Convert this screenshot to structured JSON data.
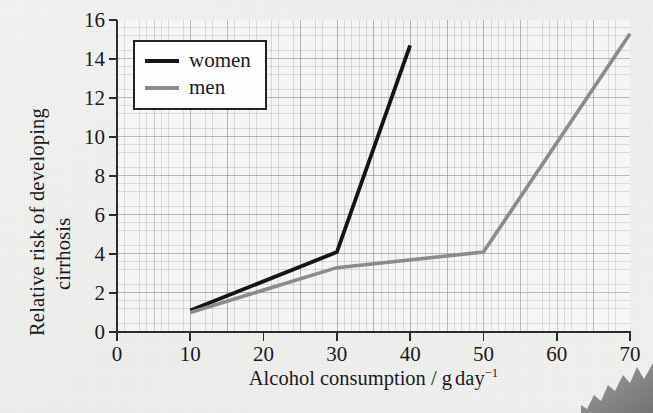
{
  "figure": {
    "background_color": "#f0f0ef",
    "plot_background_color": "#f4f4f3"
  },
  "axes": {
    "y_title_line1": "Relative risk of developing",
    "y_title_line2": "cirrhosis",
    "x_title_prefix": "Alcohol consumption / g",
    "x_title_unit": "day",
    "x_title_exponent": "−1"
  },
  "legend": {
    "entries": [
      {
        "label": "women",
        "color": "#141414"
      },
      {
        "label": "men",
        "color": "#8b8b8b"
      }
    ]
  },
  "chart_data": {
    "type": "line",
    "title": "",
    "xlabel": "Alcohol consumption / g day⁻¹",
    "ylabel": "Relative risk of developing cirrhosis",
    "xlim": [
      0,
      70
    ],
    "ylim": [
      0,
      16
    ],
    "xticks": [
      0,
      10,
      20,
      30,
      40,
      50,
      60,
      70
    ],
    "yticks": [
      0,
      2,
      4,
      6,
      8,
      10,
      12,
      14,
      16
    ],
    "xtick_labels": [
      "0",
      "10",
      "20",
      "30",
      "40",
      "50",
      "60",
      "70"
    ],
    "ytick_labels": [
      "0",
      "2",
      "4",
      "6",
      "8",
      "10",
      "12",
      "14",
      "16"
    ],
    "grid": true,
    "grid_style": "graph-paper minor 2 units / major 10 units",
    "legend_position": "upper left",
    "series": [
      {
        "name": "women",
        "color": "#141414",
        "x": [
          10,
          30,
          40
        ],
        "y": [
          1.1,
          4.1,
          14.7
        ]
      },
      {
        "name": "men",
        "color": "#8b8b8b",
        "x": [
          10,
          30,
          50,
          70
        ],
        "y": [
          1.0,
          3.3,
          4.1,
          15.3
        ]
      }
    ]
  }
}
